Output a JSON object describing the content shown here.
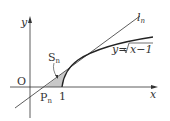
{
  "diagram": {
    "axes": {
      "x_label": "x",
      "y_label": "y",
      "origin_label": "O"
    },
    "labels": {
      "tangent": "l",
      "tangent_sub": "n",
      "curve": "y=√x−1",
      "curve_prefix": "y=",
      "curve_radicand": "x−1",
      "area": "S",
      "area_sub": "n",
      "point": "P",
      "point_sub": "n",
      "tick_one": "1"
    },
    "colors": {
      "line": "#333333",
      "shade": "#c8c8c8"
    }
  }
}
